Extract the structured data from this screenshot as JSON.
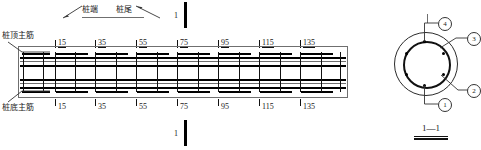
{
  "drawing": {
    "title_section": "1—1",
    "header_labels": {
      "left": "桩端",
      "right": "桩尾"
    },
    "side_labels": {
      "top_rebar": "桩顶主筋",
      "bottom_rebar": "桩底主筋"
    },
    "section_cut": {
      "mark_top": "1",
      "mark_bottom": "1"
    },
    "stations_top": [
      "15",
      "35",
      "55",
      "75",
      "95",
      "115",
      "135"
    ],
    "stations_bottom": [
      "15",
      "35",
      "55",
      "75",
      "95",
      "115",
      "135"
    ],
    "cross_section": {
      "callouts": [
        "①",
        "②",
        "③",
        "④"
      ],
      "callout_4": "4",
      "callout_3": "3",
      "callout_2": "2",
      "callout_1": "1",
      "rebar_count": 6
    },
    "colors": {
      "ink": "#111111",
      "thin_ink": "#6f6f6f",
      "paper": "#ffffff"
    }
  }
}
